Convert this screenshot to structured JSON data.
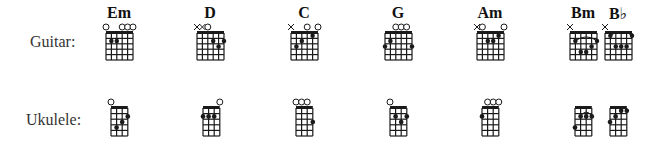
{
  "rows": [
    {
      "label": "Guitar:",
      "instrument": "guitar"
    },
    {
      "label": "Ukulele:",
      "instrument": "ukulele"
    }
  ],
  "chords": [
    {
      "name": "Em",
      "guitar": {
        "strings": [
          "o",
          "",
          "",
          "o",
          "o",
          "o"
        ],
        "dots": [
          [
            2,
            2
          ],
          [
            3,
            2
          ]
        ],
        "barre": null
      },
      "ukulele": {
        "strings": [
          "o",
          "",
          "",
          ""
        ],
        "dots": [
          [
            2,
            4
          ],
          [
            3,
            3
          ],
          [
            4,
            2
          ]
        ],
        "barre": null
      }
    },
    {
      "name": "D",
      "guitar": {
        "strings": [
          "x",
          "x",
          "o",
          "",
          "",
          ""
        ],
        "dots": [
          [
            4,
            2
          ],
          [
            5,
            3
          ],
          [
            6,
            2
          ]
        ],
        "barre": null
      },
      "ukulele": {
        "strings": [
          "",
          "",
          "",
          "o"
        ],
        "dots": [
          [
            1,
            2
          ],
          [
            2,
            2
          ],
          [
            3,
            2
          ]
        ],
        "barre": null
      }
    },
    {
      "name": "C",
      "guitar": {
        "strings": [
          "x",
          "",
          "",
          "o",
          "",
          "o"
        ],
        "dots": [
          [
            2,
            3
          ],
          [
            3,
            2
          ],
          [
            5,
            1
          ]
        ],
        "barre": null
      },
      "ukulele": {
        "strings": [
          "o",
          "o",
          "o",
          ""
        ],
        "dots": [
          [
            4,
            3
          ]
        ],
        "barre": null
      }
    },
    {
      "name": "G",
      "guitar": {
        "strings": [
          "",
          "",
          "o",
          "o",
          "o",
          ""
        ],
        "dots": [
          [
            1,
            3
          ],
          [
            2,
            2
          ],
          [
            6,
            3
          ]
        ],
        "barre": null
      },
      "ukulele": {
        "strings": [
          "o",
          "",
          "",
          ""
        ],
        "dots": [
          [
            2,
            2
          ],
          [
            3,
            3
          ],
          [
            4,
            2
          ]
        ],
        "barre": null
      }
    },
    {
      "name": "Am",
      "guitar": {
        "strings": [
          "x",
          "o",
          "",
          "",
          "",
          "o"
        ],
        "dots": [
          [
            3,
            2
          ],
          [
            4,
            2
          ],
          [
            5,
            1
          ]
        ],
        "barre": null
      },
      "ukulele": {
        "strings": [
          "",
          "o",
          "o",
          "o"
        ],
        "dots": [
          [
            1,
            2
          ]
        ],
        "barre": null
      }
    },
    {
      "name": "Bm",
      "guitar": {
        "strings": [
          "x",
          "",
          "",
          "",
          "",
          ""
        ],
        "dots": [
          [
            2,
            2
          ],
          [
            3,
            4
          ],
          [
            4,
            4
          ],
          [
            5,
            3
          ],
          [
            6,
            2
          ]
        ],
        "barre": [
          2,
          2,
          6
        ]
      },
      "ukulele": {
        "strings": [
          "",
          "",
          "",
          ""
        ],
        "dots": [
          [
            1,
            4
          ],
          [
            2,
            2
          ],
          [
            3,
            2
          ],
          [
            4,
            2
          ]
        ],
        "barre": [
          2,
          2,
          4
        ]
      }
    },
    {
      "name": "B♭",
      "guitar": {
        "strings": [
          "x",
          "",
          "",
          "",
          "",
          ""
        ],
        "dots": [
          [
            2,
            1
          ],
          [
            3,
            3
          ],
          [
            4,
            3
          ],
          [
            5,
            3
          ],
          [
            6,
            1
          ]
        ],
        "barre": [
          1,
          2,
          6
        ]
      },
      "ukulele": {
        "strings": [
          "",
          "",
          "",
          ""
        ],
        "dots": [
          [
            1,
            3
          ],
          [
            2,
            2
          ],
          [
            3,
            1
          ],
          [
            4,
            1
          ]
        ],
        "barre": [
          1,
          3,
          4
        ]
      }
    }
  ],
  "colors": {
    "ink": "#1a1a1a",
    "background": "#ffffff"
  }
}
